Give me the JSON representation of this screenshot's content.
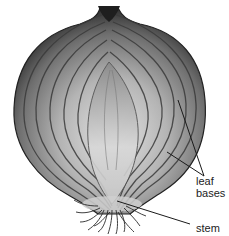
{
  "figure": {
    "labels": {
      "leaf_bases": "leaf\nbases",
      "leaf_line1": "leaf",
      "leaf_line2": "bases",
      "stem": "stem"
    }
  },
  "colors": {
    "background": "#ffffff",
    "onion_dark": "#2a2a2a",
    "onion_mid": "#7a7a7a",
    "onion_light": "#d6d6d6",
    "leader_line": "#1a1a1a"
  }
}
